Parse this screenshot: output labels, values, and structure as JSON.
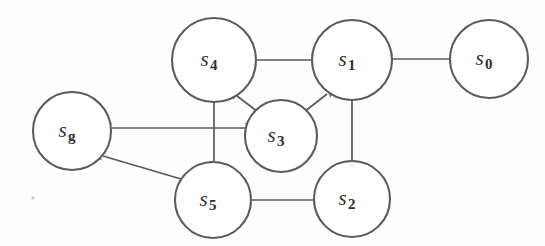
{
  "figure": {
    "background_color": "#fdfdfd",
    "node_fill": "#ffffff",
    "node_stroke": "#5c5c5c",
    "edge_color": "#5a5a5a",
    "label_color": "#2f2f2f",
    "width": 545,
    "height": 246
  },
  "nodes": [
    {
      "id": "s4",
      "base": "s",
      "sub": "4",
      "cx": 214,
      "cy": 60,
      "r": 42
    },
    {
      "id": "s1",
      "base": "s",
      "sub": "1",
      "cx": 352,
      "cy": 60,
      "r": 40
    },
    {
      "id": "s0",
      "base": "s",
      "sub": "0",
      "cx": 489,
      "cy": 59,
      "r": 39
    },
    {
      "id": "sg",
      "base": "s",
      "sub": "g",
      "cx": 72,
      "cy": 131,
      "r": 39
    },
    {
      "id": "s3",
      "base": "s",
      "sub": "3",
      "cx": 281,
      "cy": 136,
      "r": 36
    },
    {
      "id": "s5",
      "base": "s",
      "sub": "5",
      "cx": 213,
      "cy": 200,
      "r": 38
    },
    {
      "id": "s2",
      "base": "s",
      "sub": "2",
      "cx": 352,
      "cy": 199,
      "r": 38
    }
  ],
  "edges": [
    {
      "id": "e-s4-s1",
      "from": "s4",
      "to": "s1",
      "bidirectional": true,
      "x1": 257,
      "y1": 60,
      "x2": 311,
      "y2": 60
    },
    {
      "id": "e-s1-s0",
      "from": "s1",
      "to": "s0",
      "bidirectional": true,
      "x1": 393,
      "y1": 59,
      "x2": 449,
      "y2": 59
    },
    {
      "id": "e-s4-s3",
      "from": "s4",
      "to": "s3",
      "bidirectional": true,
      "x1": 237,
      "y1": 96,
      "x2": 258,
      "y2": 112
    },
    {
      "id": "e-s3-s1",
      "from": "s3",
      "to": "s1",
      "bidirectional": true,
      "x1": 304,
      "y1": 112,
      "x2": 327,
      "y2": 94
    },
    {
      "id": "e-sg-s3",
      "from": "sg",
      "to": "s3",
      "bidirectional": true,
      "x1": 112,
      "y1": 128,
      "x2": 245,
      "y2": 128
    },
    {
      "id": "e-s4-s5",
      "from": "s4",
      "to": "s5",
      "bidirectional": true,
      "x1": 214,
      "y1": 102,
      "x2": 214,
      "y2": 161
    },
    {
      "id": "e-s1-s2",
      "from": "s1",
      "to": "s2",
      "bidirectional": true,
      "x1": 352,
      "y1": 101,
      "x2": 352,
      "y2": 160
    },
    {
      "id": "e-s5-s2",
      "from": "s5",
      "to": "s2",
      "bidirectional": true,
      "x1": 252,
      "y1": 200,
      "x2": 313,
      "y2": 200
    },
    {
      "id": "e-sg-s5",
      "from": "sg",
      "to": "s5",
      "bidirectional": true,
      "x1": 103,
      "y1": 156,
      "x2": 181,
      "y2": 179
    }
  ]
}
